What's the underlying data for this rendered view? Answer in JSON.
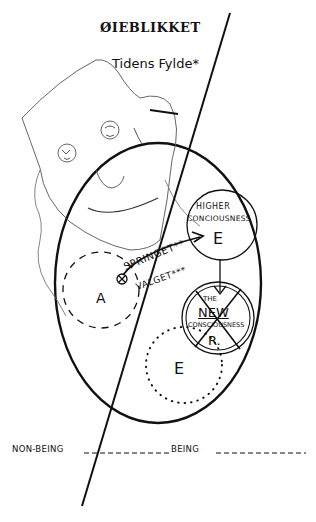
{
  "diagram": {
    "title": "ØIEBLIKKET",
    "subtitle": "Tidens Fylde*",
    "colors": {
      "ink": "#111111",
      "background": "#ffffff",
      "sketch": "#555555"
    },
    "nodes": {
      "higher": {
        "line1": "HIGHER",
        "line2": "CONCIOUSNESS",
        "letter": "E"
      },
      "new": {
        "line1": "THE",
        "line2": "NEW",
        "line3": "CONSCIOUSNESS",
        "letter": "R."
      },
      "dotted_circle": {
        "letter": "E"
      },
      "dashed_circle": {
        "letter": "A"
      }
    },
    "arrow_labels": {
      "springet": "SPRINGET**",
      "valget": "VALGET***"
    },
    "axis": {
      "left": "NON-BEING",
      "right": "BEING"
    },
    "elements": [
      "large-oval",
      "diagonal-dividing-line",
      "sketched-face",
      "crossed-circle-origin",
      "curved-arrow",
      "down-arrow"
    ]
  }
}
